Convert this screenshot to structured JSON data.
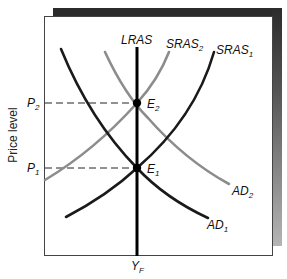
{
  "diagram": {
    "type": "AD-AS macroeconomic model",
    "y_axis_label": "Price level",
    "x_axis_tick": {
      "main": "Y",
      "sub": "F"
    },
    "price_levels": [
      {
        "main": "P",
        "sub": "2"
      },
      {
        "main": "P",
        "sub": "1"
      }
    ],
    "curves": {
      "lras": {
        "label": "LRAS"
      },
      "sras2": {
        "main": "SRAS",
        "sub": "2"
      },
      "sras1": {
        "main": "SRAS",
        "sub": "1"
      },
      "ad2": {
        "main": "AD",
        "sub": "2"
      },
      "ad1": {
        "main": "AD",
        "sub": "1"
      }
    },
    "equilibria": [
      {
        "main": "E",
        "sub": "2"
      },
      {
        "main": "E",
        "sub": "1"
      }
    ],
    "colors": {
      "dark_curve": "#1a1a1a",
      "light_curve": "#8c8c8c",
      "lras": "#000000",
      "frame": "#333333",
      "shadow_top": "#2b2b2b",
      "shadow_bottom": "#b5b5b5"
    }
  }
}
